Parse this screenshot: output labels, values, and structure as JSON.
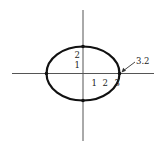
{
  "figure": {
    "type": "ellipse-on-axes",
    "colors": {
      "axis": "#555555",
      "curve": "#111111",
      "text": "#222222"
    },
    "ellipse": {
      "cx": 83,
      "cy": 73.5,
      "rx": 36.5,
      "ry": 27
    },
    "y_tick_labels": [
      {
        "text": "2",
        "x": 77,
        "y": 58
      },
      {
        "text": "1",
        "x": 77,
        "y": 68
      }
    ],
    "x_tick_labels": [
      {
        "text": "1",
        "x": 94,
        "y": 86
      },
      {
        "text": "2",
        "x": 105,
        "y": 86
      },
      {
        "text": "3",
        "x": 117,
        "y": 86
      }
    ],
    "intercept_label": {
      "text": "3.2"
    }
  }
}
